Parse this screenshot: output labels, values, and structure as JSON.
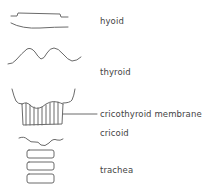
{
  "diagram": {
    "type": "anatomical-line-drawing",
    "stroke_color": "#6a6a6a",
    "labels": {
      "hyoid": "hyoid",
      "thyroid": "thyroid",
      "cricothyroid_membrane": "cricothyroid membrane",
      "cricoid": "cricoid",
      "trachea": "trachea"
    },
    "structures": [
      {
        "name": "hyoid",
        "label_ref": "hyoid"
      },
      {
        "name": "thyroid",
        "label_ref": "thyroid"
      },
      {
        "name": "cricothyroid membrane",
        "label_ref": "cricothyroid_membrane",
        "has_leader_line": true
      },
      {
        "name": "cricoid",
        "label_ref": "cricoid"
      },
      {
        "name": "trachea",
        "label_ref": "trachea",
        "ring_count": 3
      }
    ]
  }
}
